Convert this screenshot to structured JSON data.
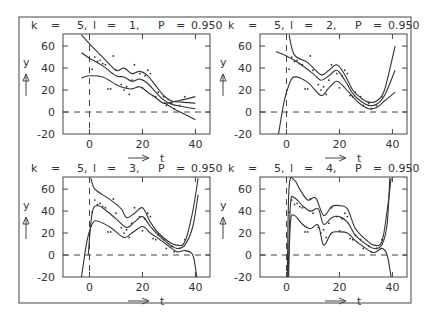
{
  "chart_data": [
    {
      "type": "scatter",
      "title": "k = 5, l = 1, P = 0.950",
      "params": {
        "k": "5",
        "l": "1",
        "P": "0.950"
      },
      "xlabel": "t",
      "ylabel": "y",
      "xticks": [
        0,
        20,
        40
      ],
      "yticks": [
        -20,
        0,
        20,
        40,
        60
      ],
      "xlim": [
        -10,
        45
      ],
      "ylim": [
        -20,
        70
      ],
      "reference_lines": {
        "hline": 0,
        "vline": 0,
        "style": "dashed"
      },
      "points": [
        [
          1,
          39
        ],
        [
          2,
          50
        ],
        [
          3,
          46
        ],
        [
          4,
          47
        ],
        [
          5,
          44
        ],
        [
          6,
          43
        ],
        [
          7,
          21
        ],
        [
          8,
          21
        ],
        [
          9,
          51
        ],
        [
          10,
          38
        ],
        [
          12,
          25
        ],
        [
          13,
          20
        ],
        [
          14,
          23
        ],
        [
          15,
          16
        ],
        [
          16,
          29
        ],
        [
          17,
          43
        ],
        [
          19,
          35
        ],
        [
          20,
          22
        ],
        [
          21,
          33
        ],
        [
          22,
          38
        ],
        [
          23,
          35
        ],
        [
          24,
          15
        ],
        [
          25,
          14
        ],
        [
          26,
          18
        ],
        [
          28,
          14
        ],
        [
          29,
          6
        ],
        [
          31,
          8
        ],
        [
          32,
          3
        ],
        [
          34,
          6
        ],
        [
          36,
          14
        ]
      ],
      "series": [
        {
          "name": "upper band",
          "x": [
            -3,
            0,
            5,
            10,
            13,
            16,
            19,
            22,
            25,
            28,
            31,
            35,
            40
          ],
          "y": [
            70,
            62,
            50,
            38,
            40,
            35,
            37,
            33,
            24,
            15,
            10,
            9,
            8
          ]
        },
        {
          "name": "fit",
          "x": [
            -3,
            0,
            5,
            10,
            13,
            16,
            19,
            22,
            25,
            28,
            31,
            35,
            40
          ],
          "y": [
            54,
            49,
            42,
            33,
            32,
            28,
            30,
            26,
            18,
            11,
            7,
            5,
            3
          ]
        },
        {
          "name": "lower band",
          "x": [
            -3,
            0,
            5,
            10,
            13,
            16,
            19,
            22,
            25,
            28,
            31,
            35,
            40
          ],
          "y": [
            31,
            33,
            32,
            25,
            22,
            21,
            23,
            18,
            13,
            8,
            9,
            11,
            14
          ]
        },
        {
          "name": "lower band ext",
          "x": [
            28,
            31,
            35,
            40
          ],
          "y": [
            9,
            4,
            -1,
            -7
          ]
        }
      ]
    },
    {
      "type": "scatter",
      "title": "k = 5, l = 2, P = 0.950",
      "params": {
        "k": "5",
        "l": "2",
        "P": "0.950"
      },
      "xlabel": "t",
      "ylabel": "y",
      "xticks": [
        0,
        20,
        40
      ],
      "yticks": [
        -20,
        0,
        20,
        40,
        60
      ],
      "xlim": [
        -10,
        45
      ],
      "ylim": [
        -20,
        70
      ],
      "reference_lines": {
        "hline": 0,
        "vline": 0,
        "style": "dashed"
      },
      "points": [
        [
          1,
          39
        ],
        [
          2,
          50
        ],
        [
          3,
          46
        ],
        [
          4,
          47
        ],
        [
          5,
          44
        ],
        [
          6,
          43
        ],
        [
          7,
          21
        ],
        [
          8,
          21
        ],
        [
          9,
          51
        ],
        [
          10,
          38
        ],
        [
          12,
          25
        ],
        [
          13,
          20
        ],
        [
          14,
          23
        ],
        [
          15,
          16
        ],
        [
          16,
          29
        ],
        [
          17,
          43
        ],
        [
          19,
          35
        ],
        [
          20,
          22
        ],
        [
          21,
          33
        ],
        [
          22,
          38
        ],
        [
          23,
          35
        ],
        [
          24,
          15
        ],
        [
          25,
          14
        ],
        [
          26,
          18
        ],
        [
          28,
          14
        ],
        [
          29,
          6
        ],
        [
          31,
          8
        ],
        [
          32,
          3
        ],
        [
          34,
          6
        ],
        [
          36,
          14
        ]
      ],
      "series": [
        {
          "name": "upper band",
          "x": [
            1,
            3,
            8,
            13,
            16,
            19,
            22,
            25,
            28,
            31,
            34,
            37,
            41
          ],
          "y": [
            70,
            52,
            45,
            34,
            38,
            43,
            34,
            20,
            13,
            9,
            10,
            20,
            60
          ]
        },
        {
          "name": "fit",
          "x": [
            -4,
            0,
            5,
            10,
            13,
            16,
            19,
            22,
            25,
            28,
            31,
            34,
            37,
            41
          ],
          "y": [
            55,
            51,
            44,
            35,
            29,
            33,
            38,
            29,
            17,
            10,
            6,
            7,
            15,
            38
          ]
        },
        {
          "name": "lower band",
          "x": [
            -3,
            -1,
            1,
            3,
            8,
            13,
            16,
            19,
            22,
            25,
            28,
            31,
            34,
            37,
            41
          ],
          "y": [
            -20,
            8,
            25,
            32,
            27,
            15,
            22,
            28,
            22,
            14,
            7,
            3,
            4,
            10,
            18
          ]
        }
      ]
    },
    {
      "type": "scatter",
      "title": "k = 5, l = 3, P = 0.950",
      "params": {
        "k": "5",
        "l": "3",
        "P": "0.950"
      },
      "xlabel": "t",
      "ylabel": "y",
      "xticks": [
        0,
        20,
        40
      ],
      "yticks": [
        -20,
        0,
        20,
        40,
        60
      ],
      "xlim": [
        -10,
        45
      ],
      "ylim": [
        -20,
        70
      ],
      "reference_lines": {
        "hline": 0,
        "vline": 0,
        "style": "dashed"
      },
      "points": [
        [
          1,
          39
        ],
        [
          2,
          50
        ],
        [
          3,
          46
        ],
        [
          4,
          47
        ],
        [
          5,
          44
        ],
        [
          6,
          43
        ],
        [
          7,
          21
        ],
        [
          8,
          21
        ],
        [
          9,
          51
        ],
        [
          10,
          38
        ],
        [
          12,
          25
        ],
        [
          13,
          20
        ],
        [
          14,
          23
        ],
        [
          15,
          16
        ],
        [
          16,
          29
        ],
        [
          17,
          43
        ],
        [
          19,
          35
        ],
        [
          20,
          22
        ],
        [
          21,
          33
        ],
        [
          22,
          38
        ],
        [
          23,
          35
        ],
        [
          24,
          15
        ],
        [
          25,
          14
        ],
        [
          26,
          18
        ],
        [
          28,
          14
        ],
        [
          29,
          6
        ],
        [
          31,
          8
        ],
        [
          32,
          3
        ],
        [
          34,
          6
        ],
        [
          36,
          14
        ]
      ],
      "series": [
        {
          "name": "upper band",
          "x": [
            0.5,
            1.5,
            3,
            8,
            12,
            14,
            17,
            20,
            23,
            26,
            30,
            33,
            36,
            39,
            41
          ],
          "y": [
            70,
            62,
            58,
            50,
            42,
            34,
            38,
            43,
            30,
            20,
            12,
            9,
            12,
            40,
            70
          ]
        },
        {
          "name": "fit",
          "x": [
            -0.5,
            1,
            3,
            6,
            10,
            14,
            17,
            20,
            23,
            26,
            30,
            33,
            36,
            39,
            41
          ],
          "y": [
            0,
            38,
            45,
            41,
            33,
            25,
            30,
            35,
            26,
            18,
            10,
            6,
            9,
            26,
            55
          ]
        },
        {
          "name": "lower band",
          "x": [
            -3,
            -1,
            1,
            3,
            8,
            13,
            16,
            20,
            23,
            26,
            30,
            33,
            36,
            39,
            40.5
          ],
          "y": [
            -20,
            12,
            28,
            31,
            25,
            16,
            20,
            26,
            20,
            15,
            8,
            3,
            4,
            0,
            -20
          ]
        }
      ]
    },
    {
      "type": "scatter",
      "title": "k = 5, l = 4, P = 0.950",
      "params": {
        "k": "5",
        "l": "4",
        "P": "0.950"
      },
      "xlabel": "t",
      "ylabel": "y",
      "xticks": [
        0,
        20,
        40
      ],
      "yticks": [
        -20,
        0,
        20,
        40,
        60
      ],
      "xlim": [
        -10,
        45
      ],
      "ylim": [
        -20,
        70
      ],
      "reference_lines": {
        "hline": 0,
        "vline": 0,
        "style": "dashed"
      },
      "points": [
        [
          1,
          39
        ],
        [
          2,
          50
        ],
        [
          3,
          46
        ],
        [
          4,
          47
        ],
        [
          5,
          44
        ],
        [
          6,
          43
        ],
        [
          7,
          21
        ],
        [
          8,
          21
        ],
        [
          9,
          51
        ],
        [
          10,
          38
        ],
        [
          12,
          25
        ],
        [
          13,
          20
        ],
        [
          14,
          23
        ],
        [
          15,
          16
        ],
        [
          16,
          29
        ],
        [
          17,
          43
        ],
        [
          19,
          35
        ],
        [
          20,
          22
        ],
        [
          21,
          33
        ],
        [
          22,
          38
        ],
        [
          23,
          35
        ],
        [
          24,
          15
        ],
        [
          25,
          14
        ],
        [
          26,
          18
        ],
        [
          28,
          14
        ],
        [
          29,
          6
        ],
        [
          31,
          8
        ],
        [
          32,
          3
        ],
        [
          34,
          6
        ],
        [
          36,
          14
        ]
      ],
      "series": [
        {
          "name": "upper band",
          "x": [
            0.3,
            1,
            3,
            5,
            8,
            11,
            14,
            17,
            20,
            23,
            26,
            30,
            33,
            36,
            38,
            39.5
          ],
          "y": [
            -20,
            62,
            68,
            60,
            50,
            52,
            36,
            44,
            45,
            42,
            24,
            14,
            9,
            12,
            40,
            70
          ]
        },
        {
          "name": "fit",
          "x": [
            0.6,
            1.5,
            3,
            6,
            9,
            12,
            14,
            17,
            20,
            23,
            26,
            30,
            33,
            36,
            38,
            39
          ],
          "y": [
            -20,
            46,
            52,
            45,
            40,
            42,
            28,
            34,
            35,
            30,
            18,
            10,
            6,
            9,
            28,
            70
          ]
        },
        {
          "name": "lower band",
          "x": [
            0.8,
            1.5,
            3,
            6,
            9,
            12,
            14,
            17,
            20,
            23,
            26,
            30,
            33,
            36,
            38,
            39.5
          ],
          "y": [
            -20,
            30,
            36,
            28,
            24,
            27,
            9,
            20,
            21,
            20,
            13,
            6,
            2,
            6,
            0,
            -20
          ]
        }
      ]
    }
  ],
  "panels": [
    {
      "k_label": "k",
      "eq": "=",
      "k": "5,",
      "l_label": "l",
      "l": "1,",
      "P_label": "P",
      "P": "0.950"
    },
    {
      "k_label": "k",
      "eq": "=",
      "k": "5,",
      "l_label": "l",
      "l": "2,",
      "P_label": "P",
      "P": "0.950"
    },
    {
      "k_label": "k",
      "eq": "=",
      "k": "5,",
      "l_label": "l",
      "l": "3,",
      "P_label": "P",
      "P": "0.950"
    },
    {
      "k_label": "k",
      "eq": "=",
      "k": "5,",
      "l_label": "l",
      "l": "4,",
      "P_label": "P",
      "P": "0.950"
    }
  ],
  "axes": {
    "xlabel": "t",
    "ylabel": "y",
    "xtick_labels": [
      "0",
      "20",
      "40"
    ],
    "ytick_labels": [
      "60",
      "40",
      "20",
      "0",
      "-20"
    ]
  },
  "colors": {
    "line": "#333333",
    "frame": "#444444",
    "background": "#ffffff"
  }
}
